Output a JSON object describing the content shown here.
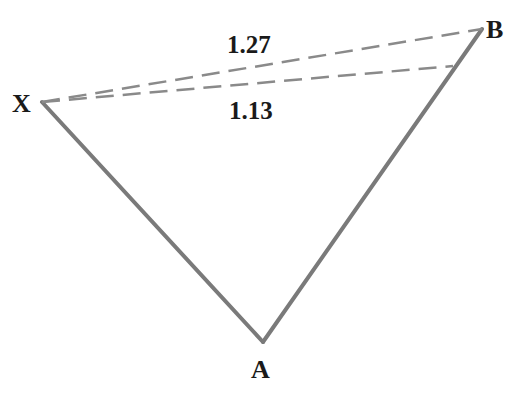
{
  "diagram": {
    "type": "harmonic-pattern-leg",
    "colors": {
      "line": "#7a7a7a",
      "dash": "#8a8a8a",
      "text": "#1a1a1a",
      "background": "#ffffff"
    },
    "points": {
      "X": {
        "label": "X",
        "x": 42,
        "y": 102
      },
      "A": {
        "label": "A",
        "x": 263,
        "y": 342
      },
      "B": {
        "label": "B",
        "x": 482,
        "y": 29
      },
      "B_alt": {
        "x": 453,
        "y": 66
      }
    },
    "ratios": [
      {
        "label": "1.27",
        "from": "X",
        "to": "B"
      },
      {
        "label": "1.13",
        "from": "X",
        "to": "B_alt"
      }
    ]
  }
}
